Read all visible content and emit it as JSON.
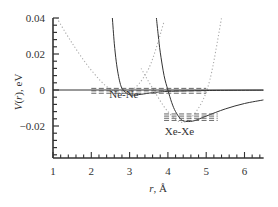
{
  "chart_data": {
    "type": "line",
    "title": "",
    "xlabel": "r, Å",
    "xlabel_italic_part": "r",
    "xlabel_rest": ", Å",
    "ylabel": "V(r), eV",
    "ylabel_V": "V",
    "ylabel_paren_open": "(",
    "ylabel_r": "r",
    "ylabel_rest": "), eV",
    "xlim": [
      1,
      6.5
    ],
    "ylim": [
      -0.038,
      0.04
    ],
    "x_ticks": [
      1,
      2,
      3,
      4,
      5,
      6
    ],
    "x_tick_labels": [
      "1",
      "2",
      "3",
      "4",
      "5",
      "6"
    ],
    "y_ticks": [
      0.04,
      0.02,
      0,
      -0.02
    ],
    "y_tick_labels": [
      "0.04",
      "0.02",
      "0",
      "−0.02"
    ],
    "grid": false,
    "legend": null,
    "annotations": [
      {
        "text": "Ne-Ne",
        "x": 2.85,
        "y": -0.0045
      },
      {
        "text": "Xe-Xe",
        "x": 4.3,
        "y": -0.025
      }
    ],
    "series": [
      {
        "name": "Ne-Ne potential",
        "style": "solid",
        "x": [
          2.55,
          2.6,
          2.65,
          2.7,
          2.75,
          2.8,
          2.9,
          3.0,
          3.1,
          3.3,
          3.6,
          4.0,
          5.0,
          6.5
        ],
        "y": [
          0.04,
          0.026,
          0.016,
          0.009,
          0.004,
          0.001,
          -0.0015,
          -0.0026,
          -0.0028,
          -0.0024,
          -0.0015,
          -0.0008,
          -0.0003,
          -0.0001
        ]
      },
      {
        "name": "Xe-Xe potential",
        "style": "solid",
        "x": [
          3.7,
          3.75,
          3.8,
          3.9,
          4.0,
          4.1,
          4.2,
          4.35,
          4.5,
          4.7,
          5.0,
          5.5,
          6.0,
          6.5
        ],
        "y": [
          0.04,
          0.03,
          0.021,
          0.008,
          0.0,
          -0.007,
          -0.012,
          -0.0165,
          -0.0175,
          -0.017,
          -0.0145,
          -0.0105,
          -0.0075,
          -0.0055
        ]
      },
      {
        "name": "Ne-Ne harmonic approximation",
        "style": "dotted",
        "x": [
          1.1,
          1.5,
          2.0,
          2.5,
          3.0,
          3.5,
          3.9
        ],
        "y": [
          0.04,
          0.026,
          0.011,
          0.0005,
          -0.001,
          0.012,
          0.038
        ]
      },
      {
        "name": "Xe-Xe harmonic approximation",
        "style": "dotted",
        "x": [
          3.3,
          3.6,
          4.0,
          4.4,
          4.8,
          5.1,
          5.4
        ],
        "y": [
          0.012,
          0.001,
          -0.012,
          -0.018,
          -0.01,
          0.006,
          0.04
        ]
      },
      {
        "name": "Ne-Ne energy levels",
        "style": "dashed",
        "levels": [
          {
            "x": [
              2.0,
              5.0
            ],
            "y": 0.0009
          },
          {
            "x": [
              2.0,
              5.0
            ],
            "y": -0.0005
          },
          {
            "x": [
              2.0,
              5.0
            ],
            "y": -0.0018
          }
        ]
      },
      {
        "name": "Xe-Xe energy levels",
        "style": "dashed",
        "levels": [
          {
            "x": [
              3.9,
              5.3
            ],
            "y": -0.0133
          },
          {
            "x": [
              3.9,
              5.3
            ],
            "y": -0.0145
          },
          {
            "x": [
              3.9,
              5.3
            ],
            "y": -0.0157
          },
          {
            "x": [
              3.9,
              5.3
            ],
            "y": -0.0169
          }
        ]
      },
      {
        "name": "zero line",
        "style": "solid",
        "x": [
          1,
          6.5
        ],
        "y": [
          0,
          0
        ]
      }
    ]
  },
  "colors": {
    "axis": "#333333",
    "solid_curve": "#333333",
    "dotted_curve": "#aaaaaa",
    "dashed_levels": "#555555",
    "text": "#333333"
  }
}
